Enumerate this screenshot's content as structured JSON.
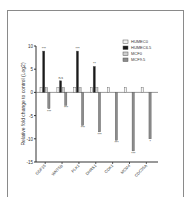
{
  "chart_data": {
    "type": "bar",
    "title": "",
    "xlabel": "",
    "ylabel": "Relative fold change to control (Log2)",
    "ylim": [
      -15,
      10
    ],
    "yticks": [
      10,
      5,
      0,
      -5,
      -10,
      -15
    ],
    "grid": false,
    "legend_position": "upper right",
    "categories": [
      "GDF15",
      "WNT5B",
      "PLK1",
      "DHRS1",
      "CDK1",
      "MCM4",
      "CDC25A"
    ],
    "series": [
      {
        "name": "HUMEC0",
        "color": "#f2f2f2",
        "values": [
          1,
          1,
          1,
          1,
          1,
          1,
          1
        ]
      },
      {
        "name": "HUMEC6.5",
        "color": "#1a1a1a",
        "values": [
          8.9,
          2.5,
          8.9,
          5.6,
          null,
          null,
          null
        ]
      },
      {
        "name": "MCF0",
        "color": "#cfcfcf",
        "values": [
          1,
          1,
          1,
          1,
          null,
          null,
          null
        ]
      },
      {
        "name": "MCF9.5",
        "color": "#8c8c8c",
        "values": [
          -3.5,
          -2.8,
          -7.1,
          -8.5,
          -10.3,
          -12.6,
          -10.0
        ]
      }
    ],
    "annotations": [
      {
        "category": "GDF15",
        "series": "HUMEC6.5",
        "text": "***"
      },
      {
        "category": "GDF15",
        "series": "MCF9.5",
        "text": "***"
      },
      {
        "category": "WNT5B",
        "series": "HUMEC6.5",
        "text": "n.s"
      },
      {
        "category": "WNT5B",
        "series": "MCF9.5",
        "text": "***"
      },
      {
        "category": "PLK1",
        "series": "HUMEC6.5",
        "text": "***"
      },
      {
        "category": "PLK1",
        "series": "MCF9.5",
        "text": "***"
      },
      {
        "category": "DHRS1",
        "series": "HUMEC6.5",
        "text": "**"
      },
      {
        "category": "DHRS1",
        "series": "MCF9.5",
        "text": "***"
      },
      {
        "category": "CDK1",
        "series": "MCF9.5",
        "text": "***"
      },
      {
        "category": "MCM4",
        "series": "MCF9.5",
        "text": "***"
      },
      {
        "category": "CDC25A",
        "series": "MCF9.5",
        "text": "*"
      }
    ]
  }
}
